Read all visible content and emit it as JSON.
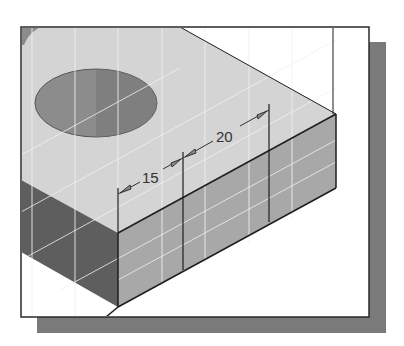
{
  "figure": {
    "colors": {
      "background": "#ffffff",
      "shadow": "#7a7a7a",
      "frame": "#2a2a2a",
      "top_face": "#d4d4d4",
      "front_face": "#a8a8a8",
      "left_face": "#5e5e5e",
      "hole": "#8c8c8c",
      "grid": "#f2f2f2",
      "edge": "#1e1e1e"
    },
    "dimensions": [
      {
        "label": "15",
        "value": 15
      },
      {
        "label": "20",
        "value": 20
      }
    ]
  }
}
